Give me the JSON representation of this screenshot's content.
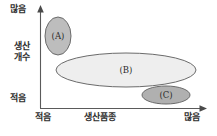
{
  "chart_data": {
    "type": "scatter",
    "title": "",
    "xlabel": "생산품종",
    "ylabel_line1": "생산",
    "ylabel_line2": "개수",
    "x_tick_low": "적음",
    "x_tick_high": "많음",
    "y_tick_low": "적음",
    "y_tick_high": "많음",
    "grid": false,
    "legend": "none",
    "axis_arrowheads": true,
    "xlim_labels": [
      "적음",
      "많음"
    ],
    "ylim_labels": [
      "적음",
      "많음"
    ],
    "regions": [
      {
        "label": "(A)",
        "shape": "ellipse",
        "fill": "#bdbdbd",
        "stroke": "#6b6b6b",
        "cx": 58,
        "cy": 36,
        "rx": 13,
        "ry": 19,
        "x_position": "적음",
        "y_position": "많음"
      },
      {
        "label": "(B)",
        "shape": "ellipse",
        "fill": "#eeeeee",
        "stroke": "#6b6b6b",
        "cx": 126,
        "cy": 70,
        "rx": 70,
        "ry": 17,
        "x_position": "적음~많음",
        "y_position": "중간"
      },
      {
        "label": "(C)",
        "shape": "ellipse",
        "fill": "#b0b0b0",
        "stroke": "#6b6b6b",
        "cx": 166,
        "cy": 95,
        "rx": 24,
        "ry": 9,
        "x_position": "많음",
        "y_position": "적음"
      }
    ],
    "colors": {
      "axis": "#5a5a5a",
      "text": "#2f2f2f",
      "region_a": "#bdbdbd",
      "region_b": "#eeeeee",
      "region_c": "#b0b0b0"
    }
  }
}
